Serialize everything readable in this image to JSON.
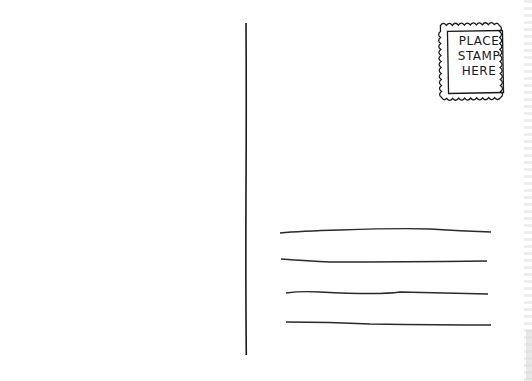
{
  "postcard": {
    "stamp": {
      "lines": [
        "PLACE",
        "STAMP",
        "HERE"
      ]
    },
    "address_lines_count": 4,
    "colors": {
      "ink": "#1a1a1a",
      "paper": "#ffffff"
    }
  }
}
